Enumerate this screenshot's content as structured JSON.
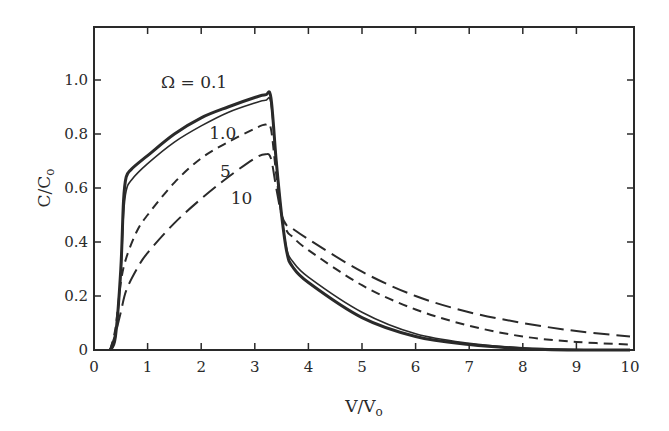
{
  "chart_data": {
    "type": "line",
    "title": "",
    "xlabel": "V/V",
    "xlabel_sub": "o",
    "ylabel": "C/C",
    "ylabel_sub": "o",
    "xlim": [
      0,
      10
    ],
    "ylim": [
      0,
      1.2
    ],
    "xticks": [
      0,
      1,
      2,
      3,
      4,
      5,
      6,
      7,
      8,
      9,
      10
    ],
    "yticks": [
      0,
      0.2,
      0.4,
      0.6,
      0.8,
      1.0
    ],
    "ytick_labels": [
      "0",
      "0.2",
      "0.4",
      "0.6",
      "0.8",
      "1.0"
    ],
    "xtick_labels": [
      "0",
      "1",
      "2",
      "3",
      "4",
      "5",
      "6",
      "7",
      "8",
      "9",
      "10"
    ],
    "grid": false,
    "legend": "inline annotations",
    "series": [
      {
        "name": "Ω = 0.1",
        "style": "solid-thick",
        "x": [
          0.3,
          0.4,
          0.5,
          0.55,
          0.6,
          0.7,
          1.0,
          1.5,
          2.0,
          2.5,
          3.0,
          3.2,
          3.3,
          3.4,
          3.5,
          3.6,
          3.7,
          4.0,
          5.0,
          6.0,
          7.0,
          8.0,
          9.0,
          10.0
        ],
        "y": [
          0.0,
          0.05,
          0.3,
          0.55,
          0.64,
          0.67,
          0.72,
          0.8,
          0.86,
          0.9,
          0.935,
          0.945,
          0.935,
          0.7,
          0.5,
          0.36,
          0.31,
          0.25,
          0.12,
          0.05,
          0.02,
          0.005,
          0.0,
          0.0
        ]
      },
      {
        "name": "1.0",
        "style": "solid-thin",
        "x": [
          0.3,
          0.4,
          0.5,
          0.55,
          0.6,
          0.7,
          1.0,
          1.5,
          2.0,
          2.5,
          3.0,
          3.2,
          3.3,
          3.4,
          3.5,
          3.6,
          3.7,
          4.0,
          5.0,
          6.0,
          7.0,
          8.0,
          9.0,
          10.0
        ],
        "y": [
          0.0,
          0.05,
          0.28,
          0.5,
          0.59,
          0.63,
          0.69,
          0.77,
          0.83,
          0.88,
          0.915,
          0.925,
          0.915,
          0.7,
          0.5,
          0.37,
          0.33,
          0.27,
          0.14,
          0.06,
          0.025,
          0.008,
          0.002,
          0.0
        ]
      },
      {
        "name": "5",
        "style": "dashed-short",
        "x": [
          0.3,
          0.4,
          0.5,
          0.6,
          0.8,
          1.0,
          1.5,
          2.0,
          2.5,
          3.0,
          3.2,
          3.3,
          3.4,
          3.5,
          3.6,
          3.7,
          4.0,
          5.0,
          6.0,
          7.0,
          8.0,
          9.0,
          10.0
        ],
        "y": [
          0.0,
          0.08,
          0.25,
          0.34,
          0.44,
          0.5,
          0.62,
          0.71,
          0.77,
          0.82,
          0.835,
          0.82,
          0.65,
          0.5,
          0.44,
          0.42,
          0.37,
          0.24,
          0.15,
          0.09,
          0.05,
          0.03,
          0.02
        ]
      },
      {
        "name": "10",
        "style": "dashed-long",
        "x": [
          0.3,
          0.4,
          0.5,
          0.6,
          0.8,
          1.0,
          1.5,
          2.0,
          2.5,
          3.0,
          3.2,
          3.3,
          3.4,
          3.5,
          3.6,
          3.7,
          4.0,
          5.0,
          6.0,
          7.0,
          8.0,
          9.0,
          10.0
        ],
        "y": [
          0.0,
          0.06,
          0.14,
          0.22,
          0.3,
          0.36,
          0.47,
          0.56,
          0.64,
          0.71,
          0.725,
          0.71,
          0.6,
          0.5,
          0.46,
          0.45,
          0.41,
          0.29,
          0.2,
          0.14,
          0.1,
          0.07,
          0.05
        ]
      }
    ],
    "annotations": [
      {
        "text": "Ω = 0.1",
        "x": 1.25,
        "y": 0.97
      },
      {
        "text": "1.0",
        "x": 2.15,
        "y": 0.78
      },
      {
        "text": "5",
        "x": 2.35,
        "y": 0.64
      },
      {
        "text": "10",
        "x": 2.55,
        "y": 0.54
      }
    ]
  }
}
